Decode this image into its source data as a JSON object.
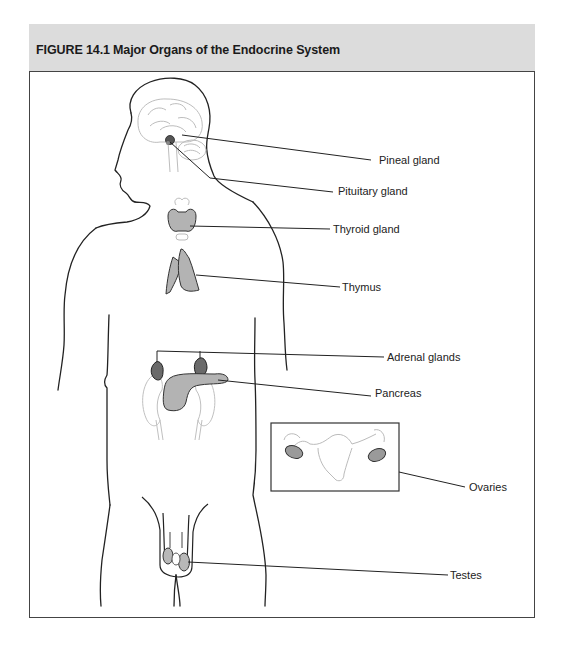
{
  "figure": {
    "number": "FIGURE 14.1",
    "title": "Major Organs of the Endocrine System"
  },
  "colors": {
    "header_bg": "#dcdcdc",
    "frame": "#444444",
    "outline": "#222222",
    "faint_outline": "#bbbbbb",
    "organ_fill_light": "#b8b8b8",
    "organ_fill_dark": "#6a6a6a"
  },
  "labels": [
    {
      "id": "pineal",
      "text": "Pineal gland"
    },
    {
      "id": "pituitary",
      "text": "Pituitary gland"
    },
    {
      "id": "thyroid",
      "text": "Thyroid gland"
    },
    {
      "id": "thymus",
      "text": "Thymus"
    },
    {
      "id": "adrenal",
      "text": "Adrenal glands"
    },
    {
      "id": "pancreas",
      "text": "Pancreas"
    },
    {
      "id": "ovaries",
      "text": "Ovaries"
    },
    {
      "id": "testes",
      "text": "Testes"
    }
  ]
}
